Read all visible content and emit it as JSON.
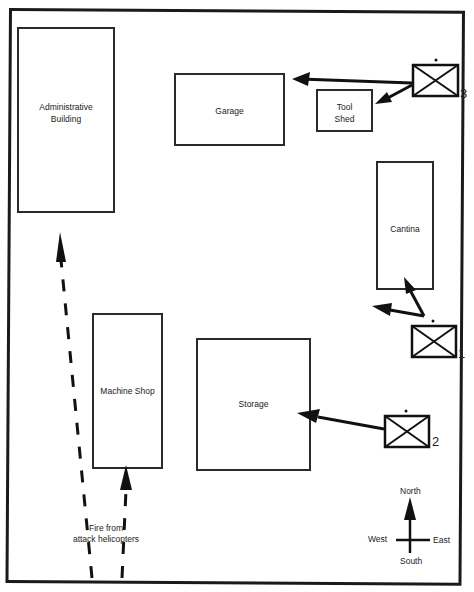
{
  "diagram": {
    "buildings": [
      {
        "id": "admin",
        "label_line1": "Administrative",
        "label_line2": "Building"
      },
      {
        "id": "garage",
        "label_line1": "Garage"
      },
      {
        "id": "toolshed",
        "label_line1": "Tool",
        "label_line2": "Shed"
      },
      {
        "id": "cantina",
        "label_line1": "Cantina"
      },
      {
        "id": "machineshop",
        "label_line1": "Machine Shop"
      },
      {
        "id": "storage",
        "label_line1": "Storage"
      }
    ],
    "units": [
      {
        "id": "unit-1",
        "number": "1"
      },
      {
        "id": "unit-2",
        "number": "2"
      },
      {
        "id": "unit-3",
        "number": "3"
      }
    ],
    "helicopter_fire": {
      "line1": "Fire from",
      "line2": "attack helicopters"
    },
    "compass": {
      "north": "North",
      "south": "South",
      "east": "East",
      "west": "West"
    }
  }
}
